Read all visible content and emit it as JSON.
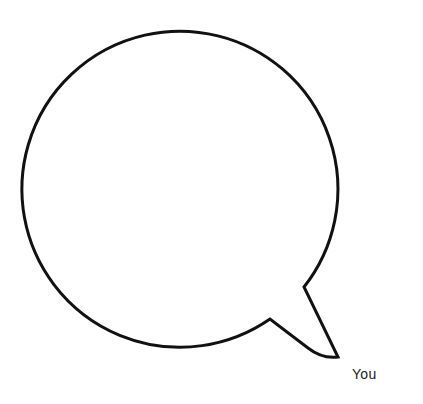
{
  "diagram": {
    "type": "speech-bubble",
    "shape": "round bubble with tail pointing down-right",
    "stroke_color": "#111111",
    "fill_color": "#ffffff",
    "bubble_text": "",
    "speaker_label": "You"
  },
  "cropped_header_fragment": ""
}
